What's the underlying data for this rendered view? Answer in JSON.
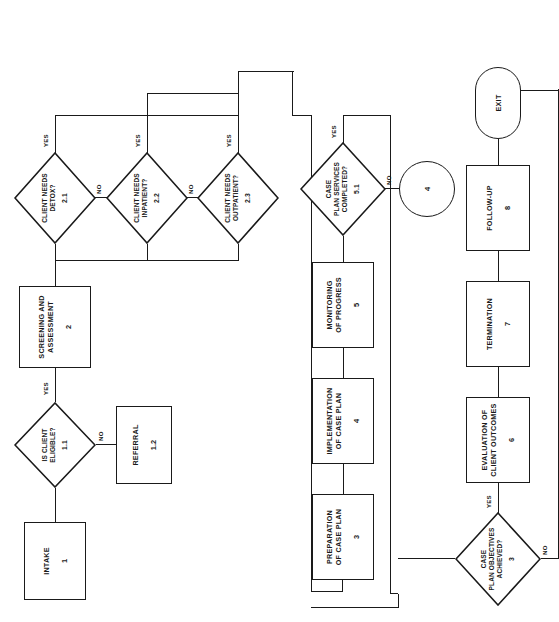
{
  "diagram": {
    "orientation": "rotated-90",
    "line_color": "#1a1a1a",
    "background": "#ffffff"
  },
  "nodes": {
    "intake": {
      "label": "INTAKE",
      "number": "1",
      "type": "process"
    },
    "eligible": {
      "label": "IS CLIENT\nELIGIBLE?",
      "l1": "IS CLIENT",
      "l2": "ELIGIBLE?",
      "number": "1.1",
      "type": "decision"
    },
    "referral": {
      "label": "REFERRAL",
      "number": "1.2",
      "type": "process"
    },
    "screening": {
      "label": "SCREENING AND ASSESSMENT",
      "l1": "SCREENING AND",
      "l2": "ASSESSMENT",
      "number": "2",
      "type": "process"
    },
    "detox": {
      "label": "CLIENT NEEDS DETOX?",
      "l1": "CLIENT NEEDS",
      "l2": "DETOX?",
      "number": "2.1",
      "type": "decision"
    },
    "inpatient": {
      "label": "CLIENT NEEDS INPATIENT?",
      "l1": "CLIENT NEEDS",
      "l2": "INPATIENT?",
      "number": "2.2",
      "type": "decision"
    },
    "outpatient": {
      "label": "CLIENT NEEDS OUTPATIENT?",
      "l1": "CLIENT NEEDS",
      "l2": "OUTPATIENT?",
      "number": "2.3",
      "type": "decision"
    },
    "preparation": {
      "label": "PREPARATION OF CASE PLAN",
      "l1": "PREPARATION",
      "l2": "OF CASE PLAN",
      "number": "3",
      "type": "process"
    },
    "implementation": {
      "label": "IMPLEMENTATION OF CASE PLAN",
      "l1": "IMPLEMENTATION",
      "l2": "OF CASE PLAN",
      "number": "4",
      "type": "process"
    },
    "monitoring": {
      "label": "MONITORING OF PROGRESS",
      "l1": "MONITORING",
      "l2": "OF PROGRESS",
      "number": "5",
      "type": "process"
    },
    "services_done": {
      "label": "CASE PLAN SERVICES COMPLETED?",
      "l1": "CASE",
      "l2": "PLAN SERVICES",
      "l3": "COMPLETED?",
      "number": "5.1",
      "type": "decision"
    },
    "connector4": {
      "label": "",
      "number": "4",
      "type": "connector"
    },
    "objectives": {
      "label": "CASE PLAN OBJECTIVES ACHIEVED?",
      "l1": "CASE",
      "l2": "PLAN OBJECTIVES",
      "l3": "ACHIEVED?",
      "number": "3",
      "type": "decision"
    },
    "evaluation": {
      "label": "EVALUATION OF CLIENT OUTCOMES",
      "l1": "EVALUATION OF",
      "l2": "CLIENT OUTCOMES",
      "number": "6",
      "type": "process"
    },
    "termination": {
      "label": "TERMINATION",
      "number": "7",
      "type": "process"
    },
    "followup": {
      "label": "FOLLOW-UP",
      "number": "8",
      "type": "process"
    },
    "exit": {
      "label": "EXIT",
      "number": "",
      "type": "terminator"
    }
  },
  "edges": {
    "yes": "YES",
    "no": "NO",
    "eligible_yes": "YES",
    "eligible_no": "NO",
    "detox_yes": "YES",
    "detox_no": "NO",
    "inpatient_yes": "YES",
    "inpatient_no": "NO",
    "outpatient_yes": "YES",
    "services_yes": "YES",
    "services_no": "NO",
    "objectives_yes": "YES",
    "objectives_no": "NO"
  }
}
